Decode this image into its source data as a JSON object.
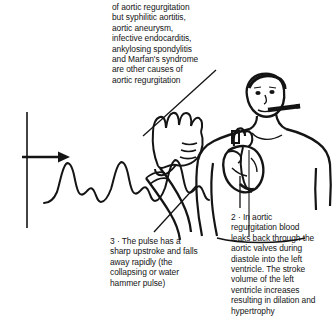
{
  "figure": {
    "title_semantic": "aortic-regurgitation-clinical-signs-illustration",
    "background_color": "#ffffff",
    "ink_color": "#141414",
    "width": 335,
    "height": 333
  },
  "notes": {
    "top": {
      "id": "causes-of-aortic-regurgitation",
      "text": "of aortic regurgitation\nbut syphilitic aortitis,\naortic aneurysm,\ninfective endocarditis,\nankylosing spondylitis\nand Marfan's syndrome\nare other causes of\naortic regurgitation"
    },
    "pulse": {
      "id": "collapsing-pulse-note",
      "number": "3",
      "text": "3 · The pulse has a\nsharp upstroke and falls\naway rapidly (the\ncollapsing or water\nhammer pulse)"
    },
    "aortic": {
      "id": "aortic-regurgitation-mechanism-note",
      "number": "2",
      "text": "2 · In aortic\nregurgitation blood\nleaks back through the\naortic valves during\ndiastole into the left\nventricle. The stroke\nvolume of the left\nventricle increases\nresulting in dilation and\nhypertrophy"
    }
  },
  "artwork": {
    "axis_line": "vertical-baseline-axis",
    "arrow": "rightward-pointing-arrow",
    "waveform": "collapsing-pulse-waveform",
    "patient": "male-torso-figure",
    "heart": "anatomical-heart-overlay",
    "cigarette": "cigarette-in-mouth",
    "hand": "hand-palpating-wrist-pulse",
    "leader_lines": [
      "leader-line-top-note",
      "leader-line-pulse-note",
      "leader-line-aortic-note"
    ]
  }
}
